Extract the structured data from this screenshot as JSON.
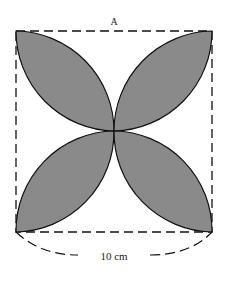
{
  "diagram": {
    "label_top": "A",
    "dimension_label": "10 cm",
    "colors": {
      "petal_fill": "#8a8a8a",
      "stroke": "#111111",
      "background": "#ffffff"
    },
    "shape": "square with four shaded lens-shaped petals meeting at center"
  }
}
